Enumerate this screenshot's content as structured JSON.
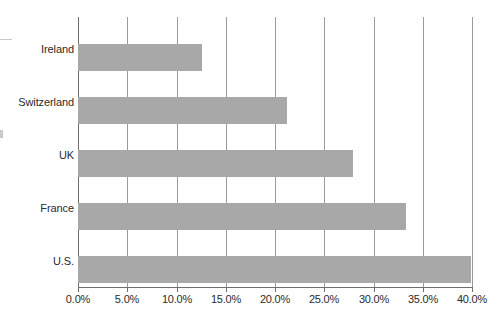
{
  "chart_data": {
    "type": "bar",
    "orientation": "horizontal",
    "title": "",
    "subtitle": "",
    "xlabel": "",
    "ylabel": "",
    "categories": [
      "Ireland",
      "Switzerland",
      "UK",
      "France",
      "U.S."
    ],
    "values": [
      12.6,
      21.2,
      27.9,
      33.3,
      39.9
    ],
    "value_unit": "%",
    "xlim": [
      0,
      40
    ],
    "x_tick_values": [
      0,
      5,
      10,
      15,
      20,
      25,
      30,
      35,
      40
    ],
    "x_tick_labels": [
      "0.0%",
      "5.0%",
      "10.0%",
      "15.0%",
      "20.0%",
      "25.0%",
      "30.0%",
      "35.0%",
      "40.0%"
    ],
    "grid": true,
    "grid_axis": "x",
    "legend": false,
    "legend_position": "none",
    "series": [
      {
        "name": "",
        "values": [
          12.6,
          21.2,
          27.9,
          33.3,
          39.9
        ]
      }
    ],
    "bar_color": "#a8a8a8",
    "axis_color": "#6f6f6f",
    "gridline_color": "#9a9a9a",
    "text_color": "#2b2b2b",
    "background_color": "#ffffff"
  }
}
